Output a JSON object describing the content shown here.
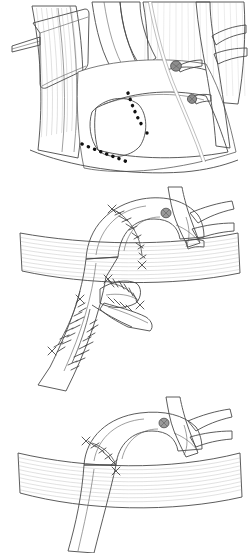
{
  "figure": {
    "type": "surgical-illustration",
    "background_color": "#ffffff",
    "panel_count": 3,
    "style": "grayscale pen-and-ink medical illustration",
    "width": 248,
    "height": 553
  },
  "palette": {
    "background": "#ffffff",
    "outline": "#4a4a4a",
    "vessel_light": "#e3e3e3",
    "vessel_mid": "#b5b5b5",
    "vessel_dark": "#8e8e8e",
    "vessel_shadow": "#6f6f6f",
    "muscle_light": "#f2f2f2",
    "muscle_mid": "#d8d8d8",
    "fiber_line": "#9a9a9a",
    "incision_dash": "#111111",
    "suture": "#3f3f3f",
    "vessel_loop": "#ffffff",
    "ligature_clip": "#8a8a8a",
    "retractor": "#ededed"
  },
  "panels": [
    {
      "id": "panel-1",
      "name": "exposure-and-incision-lines",
      "caption": "Exposure with dashed resection lines over the aneurysm",
      "top": 0,
      "height": 185,
      "structures": [
        {
          "name": "retractor-blade",
          "interactable": false
        },
        {
          "name": "muscle-band-left",
          "interactable": false
        },
        {
          "name": "muscle-band-upper",
          "interactable": false
        },
        {
          "name": "aneurysm-sac",
          "interactable": false
        },
        {
          "name": "aortic-arch",
          "interactable": false
        },
        {
          "name": "branch-vessel-upper",
          "interactable": false
        },
        {
          "name": "branch-vessel-lower",
          "interactable": false
        },
        {
          "name": "ligature-clip-upper",
          "interactable": false
        },
        {
          "name": "ligature-clip-lower",
          "interactable": false
        },
        {
          "name": "vessel-loop-tape",
          "interactable": false
        },
        {
          "name": "incision-dashed-line-proximal",
          "interactable": false
        },
        {
          "name": "incision-dashed-line-distal",
          "interactable": false
        }
      ]
    },
    {
      "id": "panel-2",
      "name": "anastomosis-with-sutures",
      "caption": "Completed suture lines on arch and descending aorta",
      "top": 185,
      "height": 210,
      "structures": [
        {
          "name": "aortic-arch",
          "interactable": false
        },
        {
          "name": "descending-aorta",
          "interactable": false
        },
        {
          "name": "muscle-band-diaphragm",
          "interactable": false
        },
        {
          "name": "branch-vessel-group",
          "interactable": false
        },
        {
          "name": "ligature-clip",
          "interactable": false
        },
        {
          "name": "suture-line-arch",
          "interactable": false
        },
        {
          "name": "suture-line-descending",
          "interactable": false
        },
        {
          "name": "suture-line-patch",
          "interactable": false
        },
        {
          "name": "patch-graft",
          "interactable": false
        }
      ]
    },
    {
      "id": "panel-3",
      "name": "final-repair",
      "caption": "Final reconstructed arch with single suture line",
      "top": 395,
      "height": 158,
      "structures": [
        {
          "name": "aortic-arch",
          "interactable": false
        },
        {
          "name": "descending-aorta",
          "interactable": false
        },
        {
          "name": "muscle-band-diaphragm",
          "interactable": false
        },
        {
          "name": "branch-vessel-group",
          "interactable": false
        },
        {
          "name": "ligature-clip",
          "interactable": false
        },
        {
          "name": "suture-line-arch",
          "interactable": false
        }
      ]
    }
  ]
}
